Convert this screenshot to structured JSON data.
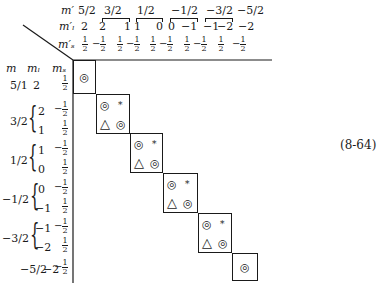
{
  "header": {
    "labels": {
      "m_prime": "m′",
      "ml_prime": "m′ₗ",
      "ms_prime": "m′ₛ"
    },
    "m_prime_values": [
      "5/2",
      "3/2",
      "1/2",
      "−1/2",
      "−3/2",
      "−5/2"
    ],
    "ml_prime_values": [
      "2",
      "2",
      "1",
      "1",
      "0",
      "0",
      "−1",
      "−1",
      "−2",
      "−2"
    ],
    "ms_prime_values": [
      "1/2",
      "−1/2",
      "1/2",
      "−1/2",
      "1/2",
      "−1/2",
      "1/2",
      "−1/2",
      "1/2",
      "−1/2"
    ]
  },
  "row_header": {
    "m": "m",
    "ml": "mₗ",
    "ms": "mₛ"
  },
  "rows": [
    {
      "m": "5/1",
      "ml": [
        "2"
      ],
      "ms": [
        "1/2"
      ]
    },
    {
      "m": "3/2",
      "ml": [
        "2",
        "1"
      ],
      "ms": [
        "−1/2",
        "1/2"
      ]
    },
    {
      "m": "1/2",
      "ml": [
        "1",
        "0"
      ],
      "ms": [
        "−1/2",
        "1/2"
      ]
    },
    {
      "m": "−1/2",
      "ml": [
        "0",
        "−1"
      ],
      "ms": [
        "−1/2",
        "1/2"
      ]
    },
    {
      "m": "−3/2",
      "ml": [
        "−1",
        "−2"
      ],
      "ms": [
        "−1/2",
        "1/2"
      ]
    },
    {
      "m": "−5/2",
      "ml": [
        "−2"
      ],
      "ms": [
        "−1/2"
      ]
    }
  ],
  "blocks": [
    {
      "size": 1,
      "cells": [
        [
          "◎"
        ]
      ]
    },
    {
      "size": 2,
      "cells": [
        [
          "◎",
          "*"
        ],
        [
          "△",
          "◎"
        ]
      ]
    },
    {
      "size": 2,
      "cells": [
        [
          "◎",
          "*"
        ],
        [
          "△",
          "◎"
        ]
      ]
    },
    {
      "size": 2,
      "cells": [
        [
          "◎",
          "*"
        ],
        [
          "△",
          "◎"
        ]
      ]
    },
    {
      "size": 2,
      "cells": [
        [
          "◎",
          "*"
        ],
        [
          "△",
          "◎"
        ]
      ]
    },
    {
      "size": 1,
      "cells": [
        [
          "◎"
        ]
      ]
    }
  ],
  "symbols": {
    "double_circle": "◎",
    "asterisk": "*",
    "triangle": "△"
  },
  "equation_number": "(8-64)"
}
